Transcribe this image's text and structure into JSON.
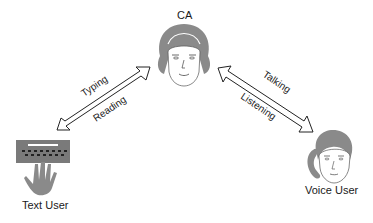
{
  "diagram": {
    "nodes": {
      "ca": {
        "label": "CA",
        "icon": "woman-headset-face-icon"
      },
      "text_user": {
        "label": "Text User",
        "icon": "keyboard-hand-icon"
      },
      "voice_user": {
        "label": "Voice User",
        "icon": "person-phone-face-icon"
      }
    },
    "edges": [
      {
        "from": "text_user",
        "to": "ca",
        "type": "double-arrow",
        "labels": [
          "Typing",
          "Reading"
        ]
      },
      {
        "from": "ca",
        "to": "voice_user",
        "type": "double-arrow",
        "labels": [
          "Talking",
          "Listening"
        ]
      }
    ]
  },
  "colors": {
    "background": "#ffffff",
    "icon_gray": "#8a8a8a",
    "keyboard_dark": "#6e6e6e",
    "arrow_stroke": "#222222"
  }
}
